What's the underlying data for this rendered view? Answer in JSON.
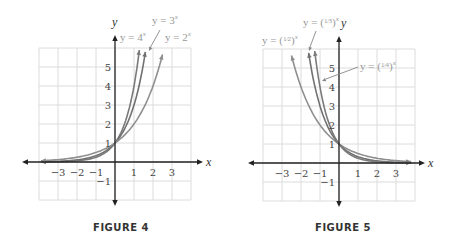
{
  "chart_data": [
    {
      "type": "line",
      "title": "FIGURE 4",
      "xlabel": "x",
      "ylabel": "y",
      "xlim": [
        -4,
        4
      ],
      "ylim": [
        -2,
        6
      ],
      "grid": true,
      "x_ticks": [
        "-3",
        "-2",
        "-1",
        "1",
        "2",
        "3"
      ],
      "y_ticks": [
        "-1",
        "1",
        "2",
        "3",
        "4",
        "5"
      ],
      "series": [
        {
          "name": "y = 4^x",
          "base": 4,
          "color": "#7a7a7a",
          "x_range": [
            -3.9,
            1.28
          ]
        },
        {
          "name": "y = 3^x",
          "base": 3,
          "color": "#707070",
          "x_range": [
            -3.9,
            1.6
          ]
        },
        {
          "name": "y = 2^x",
          "base": 2,
          "color": "#8f8f8f",
          "x_range": [
            -3.9,
            2.5
          ]
        }
      ],
      "annotations": [
        {
          "text": "y = 4^x",
          "x_px": 120,
          "y_px": 41
        },
        {
          "text": "y = 3^x",
          "x_px": 152,
          "y_px": 24
        },
        {
          "text": "y = 2^x",
          "x_px": 165,
          "y_px": 41
        }
      ]
    },
    {
      "type": "line",
      "title": "FIGURE 5",
      "xlabel": "x",
      "ylabel": "y",
      "xlim": [
        -4,
        4
      ],
      "ylim": [
        -2,
        6
      ],
      "grid": true,
      "x_ticks": [
        "-3",
        "-2",
        "-1",
        "1",
        "2",
        "3"
      ],
      "y_ticks": [
        "-1",
        "1",
        "2",
        "3",
        "4",
        "5"
      ],
      "series": [
        {
          "name": "y = (1/2)^x",
          "base": 0.5,
          "color": "#8f8f8f",
          "x_range": [
            -2.5,
            3.8
          ]
        },
        {
          "name": "y = (1/3)^x",
          "base": 0.3333,
          "color": "#707070",
          "x_range": [
            -1.6,
            3.8
          ]
        },
        {
          "name": "y = (1/4)^x",
          "base": 0.25,
          "color": "#7a7a7a",
          "x_range": [
            -1.28,
            3.8
          ]
        }
      ],
      "annotations": [
        {
          "text": "y = (1/2)^x",
          "x_px": 262,
          "y_px": 44
        },
        {
          "text": "y = (1/3)^x",
          "x_px": 303,
          "y_px": 26
        },
        {
          "text": "y = (1/4)^x",
          "x_px": 360,
          "y_px": 70
        }
      ]
    }
  ],
  "figures": [
    {
      "caption": "FIGURE 4",
      "x_axis_label": "x",
      "y_axis_label": "y"
    },
    {
      "caption": "FIGURE 5",
      "x_axis_label": "x",
      "y_axis_label": "y"
    }
  ]
}
